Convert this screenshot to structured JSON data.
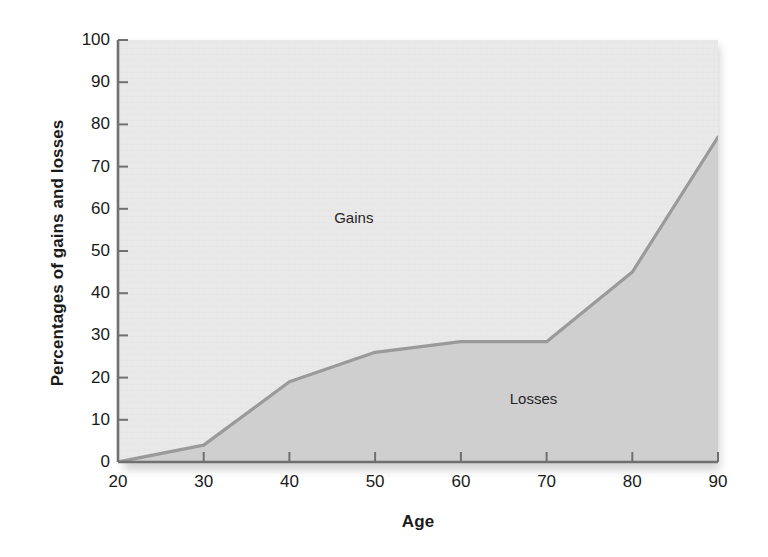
{
  "chart_data": {
    "type": "area",
    "title": "",
    "xlabel": "Age",
    "ylabel": "Percentages of gains and losses",
    "x": [
      20,
      30,
      40,
      50,
      60,
      70,
      80,
      90
    ],
    "xlim": [
      20,
      90
    ],
    "ylim": [
      0,
      100
    ],
    "xticks": [
      "20",
      "30",
      "40",
      "50",
      "60",
      "70",
      "80",
      "90"
    ],
    "yticks": [
      "0",
      "10",
      "20",
      "30",
      "40",
      "50",
      "60",
      "70",
      "80",
      "90",
      "100"
    ],
    "grid": false,
    "legend_position": "in-plot-annotations",
    "series": [
      {
        "name": "Losses",
        "values": [
          0,
          4,
          19,
          26,
          28.5,
          28.5,
          45,
          77
        ],
        "fill_color": "#cfcfcf",
        "line_color": "#9a9a9a",
        "region": "below-curve"
      },
      {
        "name": "Gains",
        "values": [
          100,
          96,
          81,
          74,
          71.5,
          71.5,
          55,
          23
        ],
        "fill_color": "#e3e3e3",
        "region": "above-curve"
      }
    ],
    "annotations": [
      {
        "text": "Gains",
        "x": 47.5,
        "y": 58
      },
      {
        "text": "Losses",
        "x": 68.5,
        "y": 15
      }
    ]
  },
  "colors": {
    "gains_fill": "#e3e3e3",
    "losses_fill": "#cfcfcf",
    "curve_line": "#9a9a9a",
    "axis": "#707070",
    "text": "#1a1a1a"
  }
}
